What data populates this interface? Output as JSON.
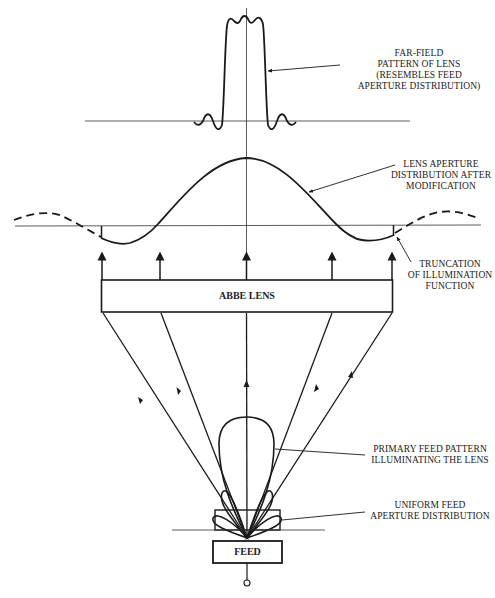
{
  "diagram": {
    "type": "Abbe lens antenna illumination schematic",
    "stroke_color": "#1a1a1a",
    "background": "#ffffff"
  },
  "blocks": {
    "lens": {
      "label": "ABBE LENS"
    },
    "feed": {
      "label": "FEED"
    }
  },
  "annotations": {
    "far_field": {
      "lines": [
        "FAR-FIELD",
        "PATTERN OF LENS",
        "(RESEMBLES FEED",
        "APERTURE DISTRIBUTION)"
      ]
    },
    "lens_aperture": {
      "lines": [
        "LENS APERTURE",
        "DISTRIBUTION AFTER",
        "MODIFICATION"
      ]
    },
    "truncation": {
      "lines": [
        "TRUNCATION",
        "OF ILLUMINATION",
        "FUNCTION"
      ]
    },
    "primary_feed": {
      "lines": [
        "PRIMARY FEED PATTERN",
        "ILLUMINATING THE LENS"
      ]
    },
    "uniform_feed": {
      "lines": [
        "UNIFORM FEED",
        "APERTURE DISTRIBUTION"
      ]
    }
  }
}
